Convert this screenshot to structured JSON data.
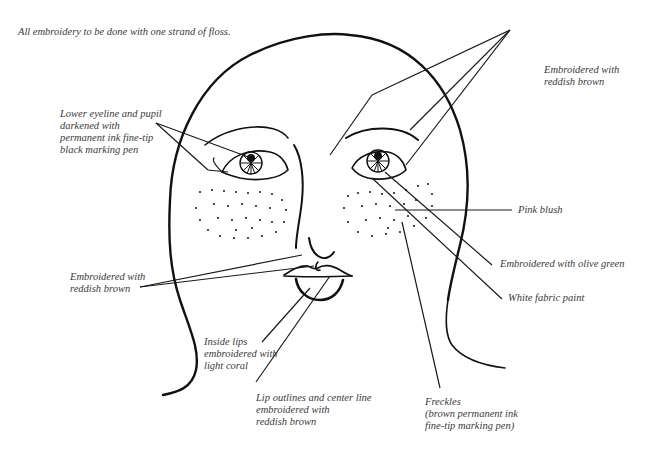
{
  "title_note": "All embroidery to be done with one strand of floss.",
  "labels": {
    "lower_eyeline": "Lower eyeline and pupil\ndarkened with\npermanent ink fine-tip\nblack marking pen",
    "reddish_brown_top": "Embroidered with\nreddish brown",
    "pink_blush": "Pink blush",
    "olive_green": "Embroidered with olive green",
    "white_paint": "White fabric paint",
    "reddish_brown_left": "Embroidered with\nreddish brown",
    "inside_lips": "Inside lips\nembroidered with\nlight coral",
    "lip_outlines": "Lip outlines and center line\nembroidered with\nreddish brown",
    "freckles": "Freckles\n(brown permanent ink\nfine-tip marking pen)"
  },
  "colors": {
    "line": "#111111",
    "text": "#3a3a3a",
    "background": "#ffffff"
  }
}
